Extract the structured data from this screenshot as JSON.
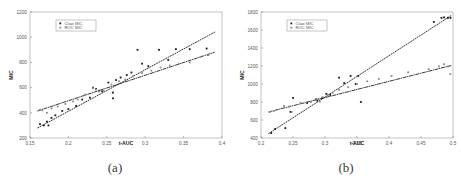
{
  "figure": {
    "panels": [
      {
        "caption": "(a)",
        "legend": {
          "entries": [
            {
              "label": "Claw MIC",
              "marker": "square",
              "color": "#1a1a1a"
            },
            {
              "label": "ROC MIC",
              "marker": "square",
              "color": "#8d8d8d"
            }
          ]
        },
        "chart_data": {
          "type": "scatter",
          "title": "",
          "xlabel": "t-AUC",
          "ylabel": "MIC",
          "xlim": [
            0.15,
            0.4
          ],
          "ylim": [
            200,
            1200
          ],
          "xticks": [
            0.15,
            0.2,
            0.25,
            0.3,
            0.35,
            0.4
          ],
          "xtick_labels": [
            "0.15",
            "0.2",
            "0.25",
            "0.3",
            "0.35",
            "0.4"
          ],
          "yticks": [
            200,
            400,
            600,
            800,
            1000,
            1200
          ],
          "ytick_labels": [
            "200",
            "400",
            "600",
            "800",
            "1000",
            "1200"
          ],
          "grid": false,
          "legend_position": "upper-left",
          "series": [
            {
              "name": "Claw MIC",
              "marker": "square",
              "color": "#1a1a1a",
              "fit_style": "dotted",
              "points": [
                [
                  0.163,
                  310
                ],
                [
                  0.168,
                  300
                ],
                [
                  0.172,
                  330
                ],
                [
                  0.174,
                  300
                ],
                [
                  0.178,
                  360
                ],
                [
                  0.183,
                  380
                ],
                [
                  0.192,
                  415
                ],
                [
                  0.2,
                  430
                ],
                [
                  0.21,
                  455
                ],
                [
                  0.218,
                  505
                ],
                [
                  0.228,
                  520
                ],
                [
                  0.232,
                  600
                ],
                [
                  0.236,
                  590
                ],
                [
                  0.24,
                  575
                ],
                [
                  0.244,
                  570
                ],
                [
                  0.252,
                  640
                ],
                [
                  0.258,
                  560
                ],
                [
                  0.258,
                  515
                ],
                [
                  0.262,
                  660
                ],
                [
                  0.268,
                  680
                ],
                [
                  0.276,
                  700
                ],
                [
                  0.282,
                  720
                ],
                [
                  0.29,
                  900
                ],
                [
                  0.296,
                  790
                ],
                [
                  0.304,
                  770
                ],
                [
                  0.318,
                  900
                ],
                [
                  0.33,
                  820
                ],
                [
                  0.34,
                  905
                ],
                [
                  0.358,
                  905
                ],
                [
                  0.38,
                  910
                ],
                [
                  0.382,
                  860
                ]
              ],
              "fit_line": {
                "x": [
                  0.16,
                  0.392
                ],
                "y": [
                  280,
                  1045
                ]
              }
            },
            {
              "name": "ROC MIC",
              "marker": "square",
              "color": "#8d8d8d",
              "fit_style": "dash-dot",
              "points": [
                [
                  0.163,
                  425
                ],
                [
                  0.166,
                  420
                ],
                [
                  0.172,
                  400
                ],
                [
                  0.178,
                  435
                ],
                [
                  0.186,
                  450
                ],
                [
                  0.196,
                  470
                ],
                [
                  0.206,
                  490
                ],
                [
                  0.212,
                  505
                ],
                [
                  0.222,
                  545
                ],
                [
                  0.232,
                  595
                ],
                [
                  0.236,
                  585
                ],
                [
                  0.24,
                  570
                ],
                [
                  0.246,
                  575
                ],
                [
                  0.256,
                  625
                ],
                [
                  0.266,
                  650
                ],
                [
                  0.274,
                  665
                ],
                [
                  0.284,
                  690
                ],
                [
                  0.296,
                  715
                ],
                [
                  0.308,
                  735
                ],
                [
                  0.32,
                  760
                ],
                [
                  0.332,
                  775
                ],
                [
                  0.344,
                  790
                ],
                [
                  0.358,
                  800
                ],
                [
                  0.372,
                  845
                ],
                [
                  0.382,
                  860
                ]
              ],
              "fit_line": {
                "x": [
                  0.16,
                  0.39
                ],
                "y": [
                  415,
                  880
                ]
              }
            }
          ]
        }
      },
      {
        "caption": "(b)",
        "legend": {
          "entries": [
            {
              "label": "Claw MIC",
              "marker": "square",
              "color": "#1a1a1a"
            },
            {
              "label": "ROC MIC",
              "marker": "square",
              "color": "#8d8d8d"
            }
          ]
        },
        "chart_data": {
          "type": "scatter",
          "title": "",
          "xlabel": "t-AUC",
          "ylabel": "MIC",
          "xlim": [
            0.2,
            0.5
          ],
          "ylim": [
            400,
            1800
          ],
          "xticks": [
            0.2,
            0.25,
            0.3,
            0.35,
            0.4,
            0.45,
            0.5
          ],
          "xtick_labels": [
            "0.2",
            "0.25",
            "0.3",
            "0.35",
            "0.4",
            "0.45",
            "0.5"
          ],
          "yticks": [
            400,
            600,
            800,
            1000,
            1200,
            1400,
            1600,
            1800
          ],
          "ytick_labels": [
            "400",
            "600",
            "800",
            "1000",
            "1200",
            "1400",
            "1600",
            "1800"
          ],
          "grid": false,
          "legend_position": "upper-left",
          "series": [
            {
              "name": "Claw MIC",
              "marker": "square",
              "color": "#1a1a1a",
              "fit_style": "dotted",
              "points": [
                [
                  0.216,
                  455
                ],
                [
                  0.222,
                  500
                ],
                [
                  0.238,
                  510
                ],
                [
                  0.246,
                  690
                ],
                [
                  0.25,
                  845
                ],
                [
                  0.272,
                  790
                ],
                [
                  0.286,
                  830
                ],
                [
                  0.288,
                  815
                ],
                [
                  0.296,
                  845
                ],
                [
                  0.302,
                  890
                ],
                [
                  0.308,
                  880
                ],
                [
                  0.322,
                  1070
                ],
                [
                  0.33,
                  1010
                ],
                [
                  0.34,
                  1090
                ],
                [
                  0.348,
                  1000
                ],
                [
                  0.352,
                  1090
                ],
                [
                  0.356,
                  800
                ],
                [
                  0.47,
                  1690
                ],
                [
                  0.482,
                  1735
                ],
                [
                  0.486,
                  1740
                ],
                [
                  0.492,
                  1735
                ],
                [
                  0.496,
                  1735
                ]
              ],
              "fit_line": {
                "x": [
                  0.212,
                  0.497
                ],
                "y": [
                  450,
                  1760
                ]
              }
            },
            {
              "name": "ROC MIC",
              "marker": "square",
              "color": "#8d8d8d",
              "fit_style": "dash-dot",
              "points": [
                [
                  0.214,
                  690
                ],
                [
                  0.22,
                  700
                ],
                [
                  0.236,
                  755
                ],
                [
                  0.244,
                  750
                ],
                [
                  0.248,
                  690
                ],
                [
                  0.262,
                  790
                ],
                [
                  0.27,
                  795
                ],
                [
                  0.278,
                  800
                ],
                [
                  0.286,
                  820
                ],
                [
                  0.29,
                  835
                ],
                [
                  0.292,
                  805
                ],
                [
                  0.296,
                  855
                ],
                [
                  0.304,
                  880
                ],
                [
                  0.312,
                  900
                ],
                [
                  0.322,
                  935
                ],
                [
                  0.336,
                  965
                ],
                [
                  0.35,
                  1000
                ],
                [
                  0.366,
                  1030
                ],
                [
                  0.384,
                  1055
                ],
                [
                  0.404,
                  1090
                ],
                [
                  0.43,
                  1130
                ],
                [
                  0.462,
                  1165
                ],
                [
                  0.478,
                  1195
                ],
                [
                  0.486,
                  1220
                ],
                [
                  0.492,
                  1195
                ],
                [
                  0.496,
                  1110
                ]
              ],
              "fit_line": {
                "x": [
                  0.212,
                  0.497
                ],
                "y": [
                  690,
                  1205
                ]
              }
            }
          ]
        }
      }
    ]
  }
}
